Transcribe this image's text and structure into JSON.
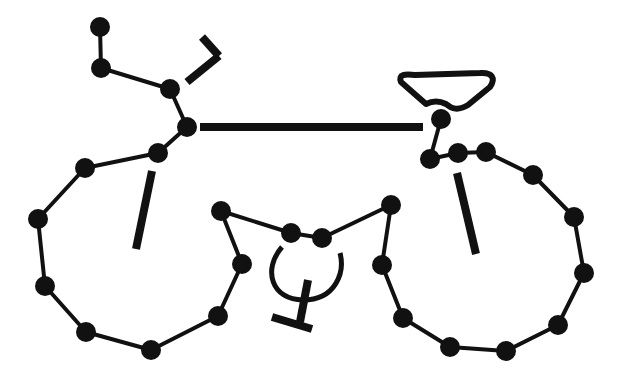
{
  "diagram": {
    "colors": {
      "stroke": "#111111",
      "background": "#ffffff"
    },
    "node_radius": 10,
    "nodes": [
      {
        "id": "h1",
        "x": 100,
        "y": 27
      },
      {
        "id": "h2",
        "x": 101,
        "y": 68
      },
      {
        "id": "h3",
        "x": 170,
        "y": 89
      },
      {
        "id": "h4",
        "x": 187,
        "y": 127
      },
      {
        "id": "h5",
        "x": 158,
        "y": 153
      },
      {
        "id": "l1",
        "x": 85,
        "y": 168
      },
      {
        "id": "l2",
        "x": 38,
        "y": 219
      },
      {
        "id": "l3",
        "x": 45,
        "y": 286
      },
      {
        "id": "l4",
        "x": 86,
        "y": 332
      },
      {
        "id": "l5",
        "x": 151,
        "y": 350
      },
      {
        "id": "l6",
        "x": 218,
        "y": 316
      },
      {
        "id": "l7",
        "x": 242,
        "y": 264
      },
      {
        "id": "c1",
        "x": 221,
        "y": 211
      },
      {
        "id": "c2",
        "x": 291,
        "y": 233
      },
      {
        "id": "c3",
        "x": 322,
        "y": 238
      },
      {
        "id": "c4",
        "x": 391,
        "y": 205
      },
      {
        "id": "r1",
        "x": 382,
        "y": 265
      },
      {
        "id": "r2",
        "x": 403,
        "y": 318
      },
      {
        "id": "r3",
        "x": 450,
        "y": 347
      },
      {
        "id": "r4",
        "x": 506,
        "y": 351
      },
      {
        "id": "r5",
        "x": 558,
        "y": 325
      },
      {
        "id": "r6",
        "x": 584,
        "y": 273
      },
      {
        "id": "r7",
        "x": 574,
        "y": 217
      },
      {
        "id": "r8",
        "x": 533,
        "y": 175
      },
      {
        "id": "r9",
        "x": 486,
        "y": 152
      },
      {
        "id": "r10",
        "x": 458,
        "y": 153
      },
      {
        "id": "r11",
        "x": 430,
        "y": 159
      },
      {
        "id": "s1",
        "x": 441,
        "y": 119
      }
    ],
    "edges": [
      [
        "h1",
        "h2"
      ],
      [
        "h2",
        "h3"
      ],
      [
        "h3",
        "h4"
      ],
      [
        "h4",
        "h5"
      ],
      [
        "h5",
        "l1"
      ],
      [
        "l1",
        "l2"
      ],
      [
        "l2",
        "l3"
      ],
      [
        "l3",
        "l4"
      ],
      [
        "l4",
        "l5"
      ],
      [
        "l5",
        "l6"
      ],
      [
        "l6",
        "l7"
      ],
      [
        "l7",
        "c1"
      ],
      [
        "c1",
        "c2"
      ],
      [
        "c2",
        "c3"
      ],
      [
        "c3",
        "c4"
      ],
      [
        "c4",
        "r1"
      ],
      [
        "r1",
        "r2"
      ],
      [
        "r2",
        "r3"
      ],
      [
        "r3",
        "r4"
      ],
      [
        "r4",
        "r5"
      ],
      [
        "r5",
        "r6"
      ],
      [
        "r6",
        "r7"
      ],
      [
        "r7",
        "r8"
      ],
      [
        "r8",
        "r9"
      ],
      [
        "r9",
        "r10"
      ],
      [
        "r10",
        "r11"
      ],
      [
        "r11",
        "s1"
      ]
    ],
    "bars": [
      {
        "name": "top-tube",
        "x1": 200,
        "y1": 127,
        "x2": 423,
        "y2": 127
      },
      {
        "name": "left-spoke",
        "x1": 152,
        "y1": 171,
        "x2": 136,
        "y2": 249
      },
      {
        "name": "right-spoke",
        "x1": 457,
        "y1": 173,
        "x2": 476,
        "y2": 254
      },
      {
        "name": "brake-lever-a",
        "x1": 187,
        "y1": 82,
        "x2": 219,
        "y2": 56
      },
      {
        "name": "brake-lever-b",
        "x1": 219,
        "y1": 56,
        "x2": 202,
        "y2": 37
      },
      {
        "name": "pedal-stem",
        "x1": 308,
        "y1": 280,
        "x2": 300,
        "y2": 322
      },
      {
        "name": "pedal-base",
        "x1": 272,
        "y1": 317,
        "x2": 312,
        "y2": 329
      }
    ],
    "seat_path": "M401,82 C398,74 405,74 415,75 L480,73 C492,72 496,78 490,87 L468,105 C458,111 452,109 446,104 C438,100 430,102 426,104 Z",
    "chainring_arc": "M282,247 C262,270 272,300 303,300 C336,300 345,272 340,253"
  }
}
